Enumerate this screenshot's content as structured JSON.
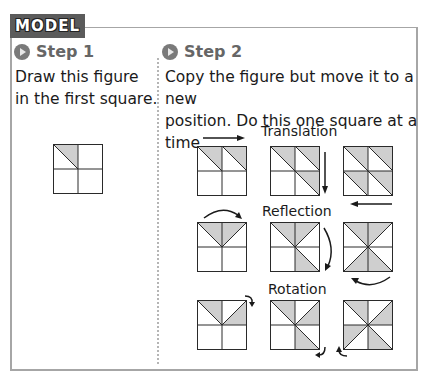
{
  "model_tab": {
    "label": "MODEL"
  },
  "step1": {
    "title": "Step 1",
    "instructions": [
      "Draw this figure",
      "in the first square."
    ]
  },
  "step2": {
    "title": "Step 2",
    "instructions": [
      "Copy the figure but move it to a new",
      "position. Do this one square at a time."
    ],
    "rows": [
      {
        "label": "Translation"
      },
      {
        "label": "Reflection"
      },
      {
        "label": "Rotation"
      }
    ]
  },
  "colors": {
    "shade": "#cfcfcf",
    "line": "#2a2a2a",
    "tab_bg": "#5b5b5b",
    "border": "#a6a6a6"
  }
}
